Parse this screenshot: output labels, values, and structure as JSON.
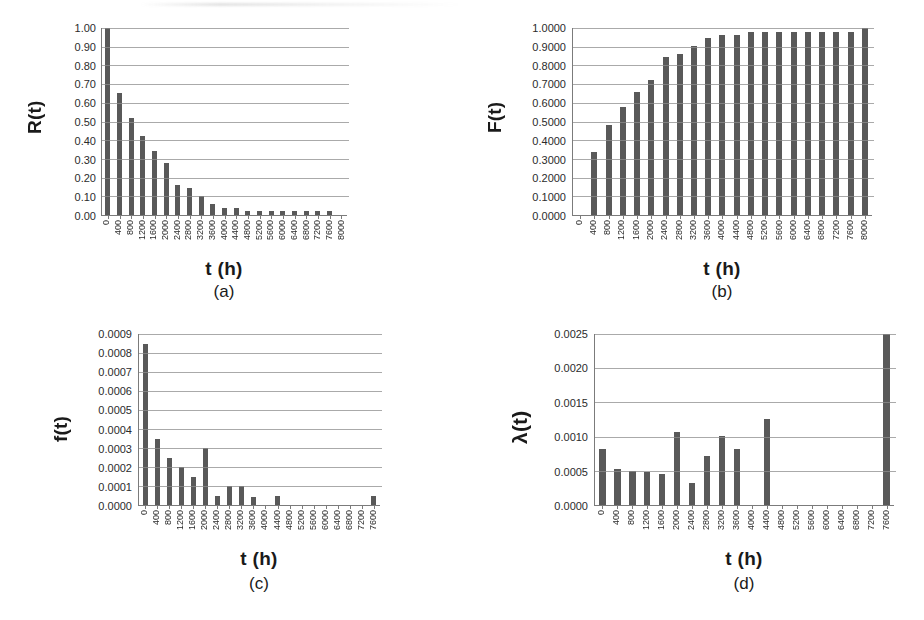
{
  "page": {
    "background": "#ffffff",
    "bar_color": "#595959",
    "axis_color": "#7b7b7b",
    "gridline_color": "#8e8e8e",
    "text_color": "#231f20"
  },
  "chart_data": [
    {
      "id": "a",
      "type": "bar",
      "title": "",
      "caption": "(a)",
      "xlabel": "t (h)",
      "ylabel": "R(t)",
      "ylim": [
        0.0,
        1.0
      ],
      "ytick_step": 0.1,
      "ytick_labels": [
        "1.00",
        "0.90",
        "0.80",
        "0.70",
        "0.60",
        "0.50",
        "0.40",
        "0.30",
        "0.20",
        "0.10",
        "0.00"
      ],
      "grid": true,
      "legend": "none",
      "categories": [
        "0",
        "400",
        "800",
        "1200",
        "1600",
        "2000",
        "2400",
        "2800",
        "3200",
        "3600",
        "4000",
        "4400",
        "4800",
        "5200",
        "5600",
        "6000",
        "6400",
        "6800",
        "7200",
        "7600",
        "8000"
      ],
      "values": [
        1.0,
        0.655,
        0.52,
        0.42,
        0.34,
        0.28,
        0.16,
        0.145,
        0.1,
        0.06,
        0.04,
        0.04,
        0.02,
        0.02,
        0.02,
        0.02,
        0.02,
        0.02,
        0.02,
        0.02,
        0.0
      ]
    },
    {
      "id": "b",
      "type": "bar",
      "title": "",
      "caption": "(b)",
      "xlabel": "t (h)",
      "ylabel": "F(t)",
      "ylim": [
        0.0,
        1.0
      ],
      "ytick_step": 0.1,
      "ytick_labels": [
        "1.0000",
        "0.9000",
        "0.8000",
        "0.7000",
        "0.6000",
        "0.5000",
        "0.4000",
        "0.3000",
        "0.2000",
        "0.1000",
        "0.0000"
      ],
      "grid": true,
      "legend": "none",
      "categories": [
        "0",
        "400",
        "800",
        "1200",
        "1600",
        "2000",
        "2400",
        "2800",
        "3200",
        "3600",
        "4000",
        "4400",
        "4800",
        "5200",
        "5600",
        "6000",
        "6400",
        "6800",
        "7200",
        "7600",
        "8000"
      ],
      "values": [
        0.0,
        0.335,
        0.48,
        0.578,
        0.66,
        0.723,
        0.843,
        0.862,
        0.905,
        0.945,
        0.962,
        0.962,
        0.978,
        0.978,
        0.978,
        0.978,
        0.978,
        0.978,
        0.978,
        0.978,
        1.0
      ]
    },
    {
      "id": "c",
      "type": "bar",
      "title": "",
      "caption": "(c)",
      "xlabel": "t (h)",
      "ylabel": "f(t)",
      "ylim": [
        0.0,
        0.0009
      ],
      "ytick_step": 0.0001,
      "ytick_labels": [
        "0.0009",
        "0.0008",
        "0.0007",
        "0.0006",
        "0.0005",
        "0.0004",
        "0.0003",
        "0.0002",
        "0.0001",
        "0.0000"
      ],
      "grid": true,
      "legend": "none",
      "categories": [
        "0",
        "400",
        "800",
        "1200",
        "1600",
        "2000",
        "2400",
        "2800",
        "3200",
        "3600",
        "4000",
        "4400",
        "4800",
        "5200",
        "5600",
        "6000",
        "6400",
        "6800",
        "7200",
        "7600"
      ],
      "values": [
        0.00085,
        0.00035,
        0.00025,
        0.0002,
        0.00015,
        0.0003,
        5e-05,
        0.0001,
        0.0001,
        4e-05,
        0.0,
        5e-05,
        0.0,
        0.0,
        0.0,
        0.0,
        0.0,
        0.0,
        0.0,
        5e-05
      ]
    },
    {
      "id": "d",
      "type": "bar",
      "title": "",
      "caption": "(d)",
      "xlabel": "t (h)",
      "ylabel": "λ(t)",
      "ylim": [
        0.0,
        0.0025
      ],
      "ytick_step": 0.0005,
      "ytick_labels": [
        "0.0025",
        "0.0020",
        "0.0015",
        "0.0010",
        "0.0005",
        "0.0000"
      ],
      "grid": true,
      "legend": "none",
      "categories": [
        "0",
        "400",
        "800",
        "1200",
        "1600",
        "2000",
        "2400",
        "2800",
        "3200",
        "3600",
        "4000",
        "4400",
        "4800",
        "5200",
        "5600",
        "6000",
        "6400",
        "6800",
        "7200",
        "7600"
      ],
      "values": [
        0.00082,
        0.00052,
        0.0005,
        0.00048,
        0.00045,
        0.00107,
        0.00032,
        0.00071,
        0.00101,
        0.00082,
        0.0,
        0.00126,
        0.0,
        0.0,
        0.0,
        0.0,
        0.0,
        0.0,
        0.0,
        0.0025
      ]
    }
  ]
}
